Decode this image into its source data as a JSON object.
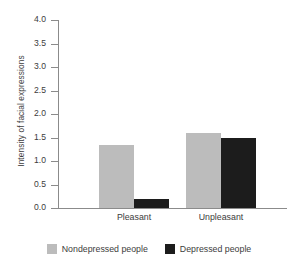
{
  "chart_data": {
    "type": "bar",
    "title": "",
    "xlabel": "",
    "ylabel": "Intensity of facial expressions",
    "categories": [
      "Pleasant",
      "Unpleasant"
    ],
    "series": [
      {
        "name": "Nondepressed people",
        "color": "#bcbcbc",
        "values": [
          1.35,
          1.6
        ]
      },
      {
        "name": "Depressed people",
        "color": "#1c1c1c",
        "values": [
          0.2,
          1.5
        ]
      }
    ],
    "ylim": [
      0.0,
      4.0
    ],
    "ytick_step": 0.5,
    "yticks": [
      "0.0",
      "0.5",
      "1.0",
      "1.5",
      "2.0",
      "2.5",
      "3.0",
      "3.5",
      "4.0"
    ],
    "grid": false,
    "legend_position": "bottom"
  },
  "axis": {
    "y_title": "Intensity of facial expressions"
  },
  "legend": {
    "items": [
      {
        "label": "Nondepressed people",
        "color": "#bcbcbc"
      },
      {
        "label": "Depressed people",
        "color": "#1c1c1c"
      }
    ]
  }
}
